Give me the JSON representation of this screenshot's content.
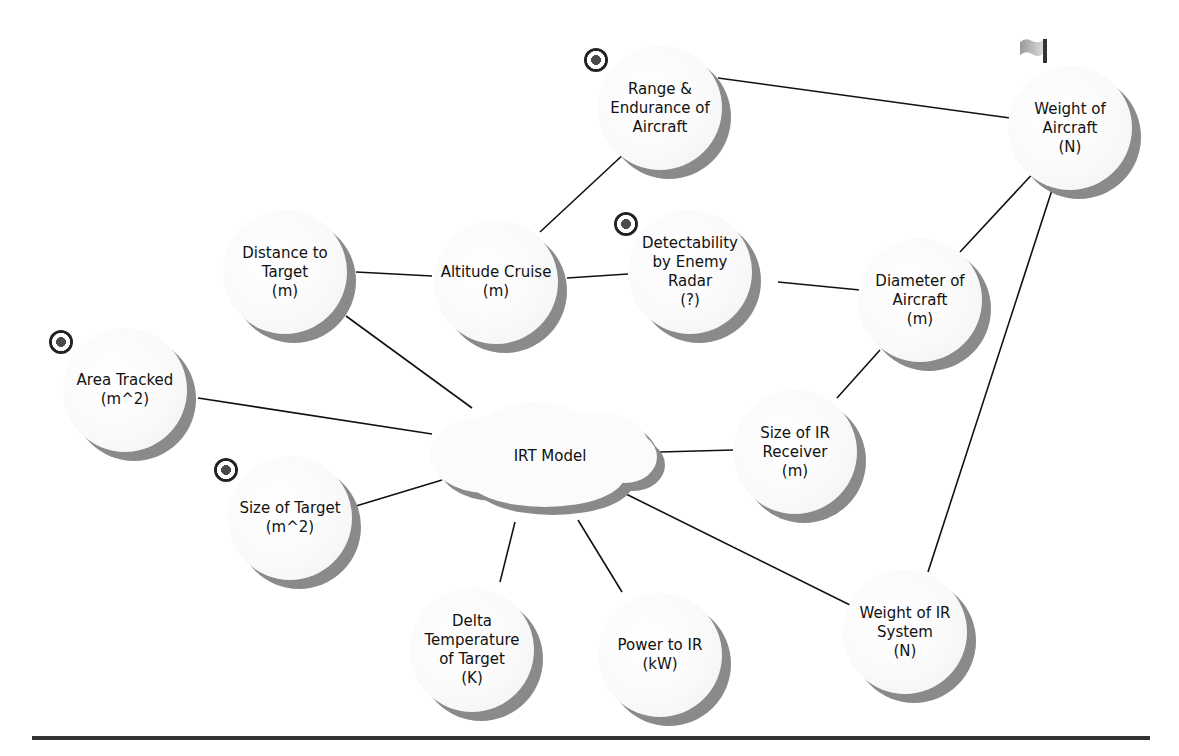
{
  "diagram": {
    "center": {
      "id": "irt",
      "label": "IRT Model",
      "x": 545,
      "y": 455
    },
    "nodes": [
      {
        "id": "range",
        "label": "Range &\nEndurance  of\nAircraft",
        "x": 660,
        "y": 108,
        "icon": "target-icon"
      },
      {
        "id": "weight_aircraft",
        "label": "Weight  of\nAircraft\n(N)",
        "x": 1070,
        "y": 128,
        "icon": "flag-icon"
      },
      {
        "id": "distance",
        "label": "Distance  to\nTarget\n(m)",
        "x": 285,
        "y": 272,
        "icon": null
      },
      {
        "id": "altitude",
        "label": "Altitude Cruise\n(m)",
        "x": 496,
        "y": 282,
        "icon": null
      },
      {
        "id": "detectability",
        "label": "Detectability\nby Enemy\nRadar\n(?)",
        "x": 690,
        "y": 272,
        "icon": "target-icon"
      },
      {
        "id": "diameter",
        "label": "Diameter of\nAircraft\n(m)",
        "x": 920,
        "y": 300,
        "icon": null
      },
      {
        "id": "area",
        "label": "Area Tracked\n(m^2)",
        "x": 125,
        "y": 390,
        "icon": "target-icon"
      },
      {
        "id": "ir_receiver",
        "label": "Size of IR\nReceiver\n(m)",
        "x": 795,
        "y": 452,
        "icon": null
      },
      {
        "id": "size_target",
        "label": "Size of Target\n(m^2)",
        "x": 290,
        "y": 518,
        "icon": "target-icon"
      },
      {
        "id": "delta_temp",
        "label": "Delta\nTemperature\nof Target\n(K)",
        "x": 472,
        "y": 650,
        "icon": null
      },
      {
        "id": "power_ir",
        "label": "Power to IR\n(kW)",
        "x": 660,
        "y": 655,
        "icon": null
      },
      {
        "id": "weight_ir",
        "label": "Weight of IR\nSystem\n(N)",
        "x": 905,
        "y": 632,
        "icon": null
      }
    ],
    "edges": [
      {
        "x1": 718,
        "y1": 78,
        "x2": 1010,
        "y2": 118
      },
      {
        "x1": 626,
        "y1": 152,
        "x2": 540,
        "y2": 232
      },
      {
        "x1": 356,
        "y1": 272,
        "x2": 432,
        "y2": 276
      },
      {
        "x1": 567,
        "y1": 278,
        "x2": 628,
        "y2": 274
      },
      {
        "x1": 778,
        "y1": 282,
        "x2": 860,
        "y2": 290
      },
      {
        "x1": 1038,
        "y1": 168,
        "x2": 960,
        "y2": 252
      },
      {
        "x1": 1052,
        "y1": 190,
        "x2": 928,
        "y2": 572
      },
      {
        "x1": 880,
        "y1": 350,
        "x2": 837,
        "y2": 398
      },
      {
        "x1": 346,
        "y1": 316,
        "x2": 472,
        "y2": 408
      },
      {
        "x1": 198,
        "y1": 398,
        "x2": 432,
        "y2": 434
      },
      {
        "x1": 660,
        "y1": 452,
        "x2": 733,
        "y2": 450
      },
      {
        "x1": 356,
        "y1": 506,
        "x2": 442,
        "y2": 480
      },
      {
        "x1": 515,
        "y1": 522,
        "x2": 500,
        "y2": 582
      },
      {
        "x1": 578,
        "y1": 520,
        "x2": 622,
        "y2": 592
      },
      {
        "x1": 626,
        "y1": 494,
        "x2": 852,
        "y2": 606
      }
    ],
    "colors": {
      "line": "#111111",
      "disc": "#fafafa",
      "shadow": "#8a8a8a",
      "divider": "#333333"
    }
  }
}
